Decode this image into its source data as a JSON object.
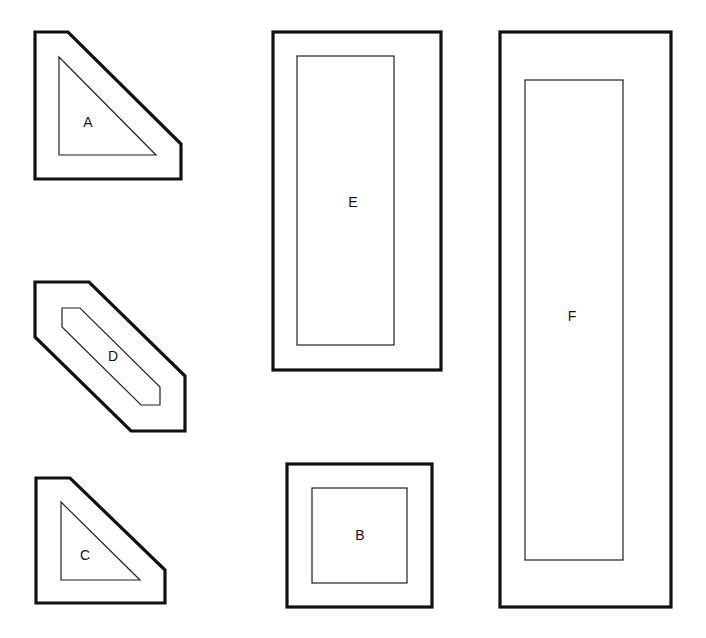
{
  "diagram": {
    "shapes": [
      {
        "id": "A",
        "label": "A",
        "outer": "pentagon (square with clipped top-right corner)",
        "inner": "right triangle"
      },
      {
        "id": "D",
        "label": "D",
        "outer": "elongated hexagon (diagonal)",
        "inner": "elongated hexagon (diagonal)"
      },
      {
        "id": "C",
        "label": "C",
        "outer": "pentagon (square with clipped top-right corner)",
        "inner": "right triangle"
      },
      {
        "id": "E",
        "label": "E",
        "outer": "rectangle",
        "inner": "rectangle"
      },
      {
        "id": "B",
        "label": "B",
        "outer": "square",
        "inner": "square"
      },
      {
        "id": "F",
        "label": "F",
        "outer": "rectangle",
        "inner": "rectangle"
      }
    ]
  }
}
